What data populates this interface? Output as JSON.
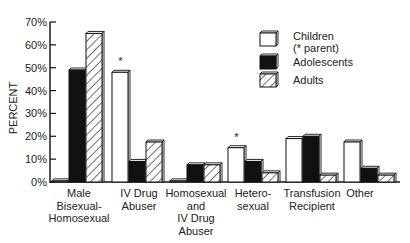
{
  "chart_data": {
    "type": "bar",
    "title": "",
    "xlabel": "",
    "ylabel": "PERCENT",
    "ylim": [
      0,
      70
    ],
    "yticks": [
      "0%",
      "10%",
      "20%",
      "30%",
      "40%",
      "50%",
      "60%",
      "70%"
    ],
    "grid": false,
    "legend_position": "upper right",
    "categories": [
      "Male Bisexual-Homosexual",
      "IV Drug Abuser",
      "Homosexual and IV Drug Abuser",
      "Hetero-sexual",
      "Transfusion Recipient",
      "Other"
    ],
    "category_lines": [
      [
        "Male",
        "Bisexual-",
        "Homosexual"
      ],
      [
        "IV Drug",
        "Abuser"
      ],
      [
        "Homosexual",
        "and",
        "IV Drug",
        "Abuser"
      ],
      [
        "Hetero-",
        "sexual"
      ],
      [
        "Transfusion",
        "Recipient"
      ],
      [
        "Other"
      ]
    ],
    "series": [
      {
        "name": "Children (* parent)",
        "fill": "white",
        "values": [
          0.5,
          48,
          0.5,
          15,
          19,
          17.5
        ]
      },
      {
        "name": "Adolescents",
        "fill": "black",
        "values": [
          49,
          9,
          7.5,
          9,
          20,
          6
        ]
      },
      {
        "name": "Adults",
        "fill": "hatched",
        "values": [
          65,
          17.5,
          7.5,
          4,
          3,
          3
        ]
      }
    ],
    "annotations": [
      {
        "text": "*",
        "category": "IV Drug Abuser",
        "series": "Children (* parent)"
      },
      {
        "text": "*",
        "category": "Hetero-sexual",
        "series": "Children (* parent)"
      }
    ],
    "legend": [
      {
        "line1": "Children",
        "line2": "(* parent)"
      },
      {
        "line1": "Adolescents"
      },
      {
        "line1": "Adults"
      }
    ]
  }
}
